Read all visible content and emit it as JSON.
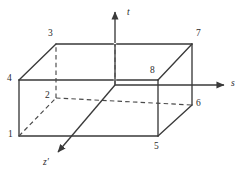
{
  "figure": {
    "background_color": "#ffffff",
    "line_color": "#3a3a3a",
    "hidden_line_color": "#4a4a4a",
    "label_color": "#2b2b2b",
    "width": 245,
    "height": 178
  },
  "axes": [
    {
      "id": "t",
      "label": "t",
      "direction": "up",
      "from": [
        115,
        85
      ],
      "to": [
        115,
        12
      ],
      "arrow": true
    },
    {
      "id": "s",
      "label": "s",
      "direction": "right",
      "from": [
        115,
        85
      ],
      "to": [
        224,
        85
      ],
      "arrow": true
    },
    {
      "id": "zprime",
      "label": "z'",
      "direction": "down-left",
      "from": [
        115,
        85
      ],
      "to": [
        58,
        152
      ],
      "arrow": true
    }
  ],
  "axis_labels": {
    "t": "t",
    "s": "s",
    "z_prime": "z′"
  },
  "vertices": [
    {
      "id": "1",
      "label": "1",
      "x": 19,
      "y": 136,
      "label_x": 8,
      "label_y": 130,
      "hidden": false
    },
    {
      "id": "2",
      "label": "2",
      "x": 56,
      "y": 98,
      "label_x": 45,
      "label_y": 91,
      "hidden": true
    },
    {
      "id": "3",
      "label": "3",
      "x": 56,
      "y": 44,
      "label_x": 48,
      "label_y": 29,
      "hidden": false
    },
    {
      "id": "4",
      "label": "4",
      "x": 19,
      "y": 80,
      "label_x": 7,
      "label_y": 74,
      "hidden": false
    },
    {
      "id": "5",
      "label": "5",
      "x": 158,
      "y": 136,
      "label_x": 154,
      "label_y": 142,
      "hidden": false
    },
    {
      "id": "6",
      "label": "6",
      "x": 192,
      "y": 105,
      "label_x": 196,
      "label_y": 99,
      "hidden": false
    },
    {
      "id": "7",
      "label": "7",
      "x": 192,
      "y": 44,
      "label_x": 196,
      "label_y": 29,
      "hidden": false
    },
    {
      "id": "8",
      "label": "8",
      "x": 158,
      "y": 80,
      "label_x": 150,
      "label_y": 66,
      "hidden": false
    }
  ],
  "edges": [
    {
      "from": "1",
      "to": "5",
      "hidden": false,
      "name": "edge-bottom-front"
    },
    {
      "from": "1",
      "to": "4",
      "hidden": false,
      "name": "edge-left-front-vertical"
    },
    {
      "from": "4",
      "to": "8",
      "hidden": false,
      "name": "edge-top-front"
    },
    {
      "from": "5",
      "to": "8",
      "hidden": false,
      "name": "edge-right-front-vertical"
    },
    {
      "from": "4",
      "to": "3",
      "hidden": false,
      "name": "edge-left-top-depth"
    },
    {
      "from": "3",
      "to": "7",
      "hidden": false,
      "name": "edge-top-back"
    },
    {
      "from": "8",
      "to": "7",
      "hidden": false,
      "name": "edge-right-top-depth"
    },
    {
      "from": "5",
      "to": "6",
      "hidden": false,
      "name": "edge-right-bottom-depth"
    },
    {
      "from": "6",
      "to": "7",
      "hidden": false,
      "name": "edge-right-back-vertical"
    },
    {
      "from": "1",
      "to": "2",
      "hidden": true,
      "name": "edge-left-bottom-depth"
    },
    {
      "from": "2",
      "to": "3",
      "hidden": true,
      "name": "edge-left-back-vertical"
    },
    {
      "from": "2",
      "to": "6",
      "hidden": true,
      "name": "edge-bottom-back"
    }
  ]
}
